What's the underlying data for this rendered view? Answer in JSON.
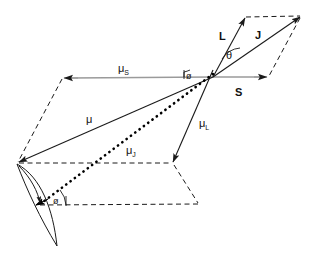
{
  "figure": {
    "type": "vector-diagram",
    "title": ""
  },
  "labels": {
    "mu_s": "μ",
    "mu_s_sub": "S",
    "mu": "μ",
    "mu_l": "μ",
    "mu_l_sub": "L",
    "mu_j": "μ",
    "mu_j_sub": "J",
    "vector_L": "L",
    "vector_J": "J",
    "vector_S": "S",
    "angle_theta": "θ",
    "angle_phi_top": "ø",
    "angle_phi_bottom": "ø"
  },
  "colors": {
    "stroke": "#1a1a1a",
    "spin_axis": "#999999",
    "background": "#ffffff",
    "dotted": "#000000"
  },
  "geometry": {
    "origin": [
      213,
      77
    ],
    "L_tip": [
      246,
      17
    ],
    "J_tip": [
      301,
      17
    ],
    "S_tip": [
      268,
      77
    ],
    "mu_s_tip": [
      62,
      78
    ],
    "mu_tip": [
      17,
      163
    ],
    "mu_l_tip": [
      173,
      163
    ],
    "mu_j_tip": [
      35,
      205
    ],
    "lower_par_corner": [
      198,
      203
    ]
  },
  "annotations": {
    "mu_s_pos": [
      118,
      67
    ],
    "mu_pos": [
      84,
      119
    ],
    "mu_l_pos": [
      200,
      123
    ],
    "mu_j_pos": [
      128,
      150
    ],
    "L_pos": [
      222,
      36
    ],
    "J_pos": [
      258,
      35
    ],
    "S_pos": [
      237,
      93
    ],
    "theta_pos": [
      229,
      56
    ],
    "phi_top_pos": [
      189,
      78
    ],
    "phi_bottom_pos": [
      56,
      202
    ]
  }
}
